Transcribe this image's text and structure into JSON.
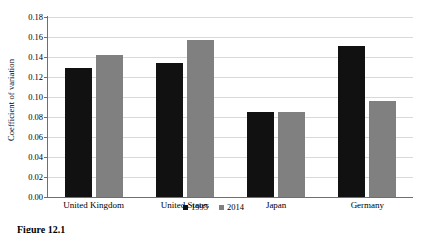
{
  "chart_data": {
    "type": "bar",
    "title": "",
    "xlabel": "",
    "ylabel": "Coefficient of variation",
    "ylim": [
      0,
      0.18
    ],
    "ytick_labels": [
      "0.00",
      "0.02",
      "0.04",
      "0.06",
      "0.08",
      "0.10",
      "0.12",
      "0.14",
      "0.16",
      "0.18"
    ],
    "ytick_values": [
      0,
      0.02,
      0.04,
      0.06,
      0.08,
      0.1,
      0.12,
      0.14,
      0.16,
      0.18
    ],
    "grid": true,
    "legend_position": "bottom-center",
    "categories": [
      "United Kingdom",
      "United States",
      "Japan",
      "Germany"
    ],
    "series": [
      {
        "name": "1995",
        "color": "#111111",
        "values": [
          0.129,
          0.134,
          0.085,
          0.151
        ]
      },
      {
        "name": "2014",
        "color": "#808080",
        "values": [
          0.142,
          0.157,
          0.085,
          0.096
        ]
      }
    ]
  },
  "caption": {
    "text": "Figure 12.1"
  }
}
